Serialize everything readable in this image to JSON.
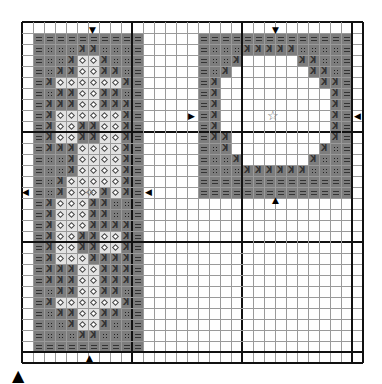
{
  "chart": {
    "cols": 31,
    "rows": 31,
    "cell_px": 11,
    "origin": [
      22,
      22
    ],
    "major_every": 10,
    "colors": {
      "dark": "#7d7d7d",
      "light": "#e2e2e2",
      "grid": "#9a9a9a",
      "major_grid": "#111111"
    },
    "legend": {
      "=": "dark-equals",
      ":": "dark-four-dots",
      ">": "dark-k-glyph",
      "o": "light-diamond",
      ".": "empty"
    },
    "designs": [
      {
        "name": "left-motif",
        "col": 1,
        "row": 1,
        "pattern": [
          "==========",
          "=:::>>:::=",
          "=::>oo>::=",
          "=:>>oo>>:=",
          "=>oooooo>=",
          "=:>>oo>>:=",
          "=>>>oo>>>=",
          "=>oooooo>=",
          "=>oo>>oo>=",
          "=>oo>>oo>=",
          "=>>>oooo>=",
          "=::>oooo>=",
          "=::>oooo>=",
          "=:>ooooo>=",
          "=:>ooo>o>=",
          "=>ooo>>::=",
          "=>ooo>>::=",
          "=>ooo>>>>=",
          "=>oo>>oo>=",
          "=>oo>>oo>=",
          "=>ooo>>>>=",
          "=>>>oo>>>=",
          "=>>>oo>>>=",
          "=:>>oo>>:=",
          "=>oooooo>=",
          "=:>>oo>>:=",
          "=::>oo>::=",
          "=:::>>:::=",
          "=========="
        ]
      },
      {
        "name": "right-frame",
        "col": 16,
        "row": 1,
        "pattern": [
          "==============",
          "=:::>>>>>::::=",
          "=::>.....>>::=",
          "=:>.......>>:=",
          "=>.........>>=",
          "=>..........>=",
          "=>..........>=",
          "=>..........>=",
          "=>..........>=",
          "=>>.........>=",
          "=:>........>:=",
          "=::>......>::=",
          "=:::>>>>>>:::=",
          "==============",
          "=============="
        ]
      }
    ],
    "center_markers": [
      {
        "name": "left-top-center-arrow",
        "glyph": "▼",
        "x": 89,
        "y": 26
      },
      {
        "name": "left-bottom-center-arrow",
        "glyph": "▲",
        "x": 86,
        "y": 354
      },
      {
        "name": "left-side-arrow",
        "glyph": "◀",
        "x": 22,
        "y": 188
      },
      {
        "name": "left-right-side-arrow",
        "glyph": "◀",
        "x": 145,
        "y": 188
      },
      {
        "name": "right-top-center-arrow",
        "glyph": "▼",
        "x": 272,
        "y": 26
      },
      {
        "name": "right-bottom-center-arrow",
        "glyph": "▲",
        "x": 272,
        "y": 196
      },
      {
        "name": "right-left-side-arrow",
        "glyph": "▶",
        "x": 188,
        "y": 112
      },
      {
        "name": "right-right-side-arrow",
        "glyph": "◀",
        "x": 354,
        "y": 112
      }
    ],
    "center_stars": [
      {
        "name": "right-frame-center-star",
        "glyph": "☆",
        "x": 267,
        "y": 109
      },
      {
        "name": "left-motif-center-star",
        "glyph": "✧",
        "x": 84,
        "y": 186
      }
    ],
    "page_arrow": {
      "glyph": "▲"
    }
  }
}
